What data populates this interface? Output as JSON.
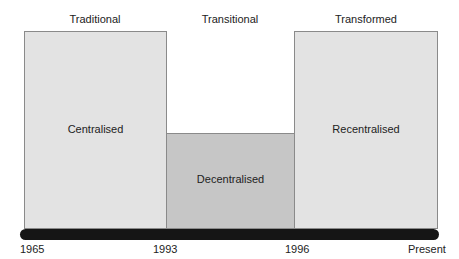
{
  "phases": [
    {
      "label": "Traditional"
    },
    {
      "label": "Transitional"
    },
    {
      "label": "Transformed"
    }
  ],
  "states": [
    {
      "label": "Centralised",
      "level": "high",
      "color": "#e3e3e3"
    },
    {
      "label": "Decentralised",
      "level": "low",
      "color": "#c6c6c6"
    },
    {
      "label": "Recentralised",
      "level": "high",
      "color": "#e3e3e3"
    }
  ],
  "timeline": {
    "ticks": [
      "1965",
      "1993",
      "1996",
      "Present"
    ],
    "color": "#151515"
  }
}
